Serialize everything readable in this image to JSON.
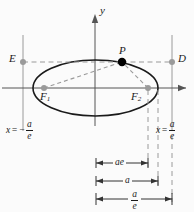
{
  "figure": {
    "kind": "ellipse-focus-directrix-diagram",
    "axes": {
      "y_label": "y",
      "x_axis_label": "",
      "origin": {
        "x": 95,
        "y": 88
      }
    },
    "points": [
      {
        "name": "E",
        "label": "E",
        "x": 23,
        "y": 62,
        "marker": "gray-dot",
        "label_dx": -12,
        "label_dy": -6
      },
      {
        "name": "D",
        "label": "D",
        "x": 172,
        "y": 62,
        "marker": "gray-dot",
        "label_dx": 5,
        "label_dy": -6
      },
      {
        "name": "P",
        "label": "P",
        "x": 122,
        "y": 62,
        "marker": "black-dot",
        "label_dx": -2,
        "label_dy": -15
      },
      {
        "name": "F1",
        "label": "F",
        "sub": "1",
        "x": 44,
        "y": 88,
        "marker": "gray-dot",
        "label_dx": -4,
        "label_dy": 4
      },
      {
        "name": "F2",
        "label": "F",
        "sub": "2",
        "x": 148,
        "y": 88,
        "marker": "gray-dot",
        "label_dx": -15,
        "label_dy": 4
      }
    ],
    "directrices": [
      {
        "name": "left-directrix",
        "equation_lhs": "x",
        "equals": "=",
        "sign": "−",
        "numerator": "a",
        "denominator": "e",
        "x": 23,
        "label_x": 8,
        "label_y": 126
      },
      {
        "name": "right-directrix",
        "equation_lhs": "x",
        "equals": "=",
        "sign": "",
        "numerator": "a",
        "denominator": "e",
        "x": 172,
        "label_x": 158,
        "label_y": 126
      }
    ],
    "dimensions": [
      {
        "name": "ae-dimension",
        "label": "ae",
        "type": "text",
        "from_x": 96,
        "to_x": 148,
        "y": 163
      },
      {
        "name": "a-dimension",
        "label": "a",
        "type": "text",
        "from_x": 96,
        "to_x": 158,
        "y": 181
      },
      {
        "name": "a-over-e-dimension",
        "numerator": "a",
        "denominator": "e",
        "type": "fraction",
        "from_x": 96,
        "to_x": 172,
        "y": 199
      }
    ],
    "colors": {
      "curve": "#1a1a1a",
      "axis": "#555555",
      "guide_gray": "#9a9a9a",
      "dot_gray": "#9a9a9a",
      "dot_black": "#000000",
      "background": "#fbfbfb",
      "text": "#1a1a1a"
    },
    "ellipse": {
      "cx": 95.5,
      "cy": 88,
      "rx": 62.5,
      "ry": 28
    }
  }
}
